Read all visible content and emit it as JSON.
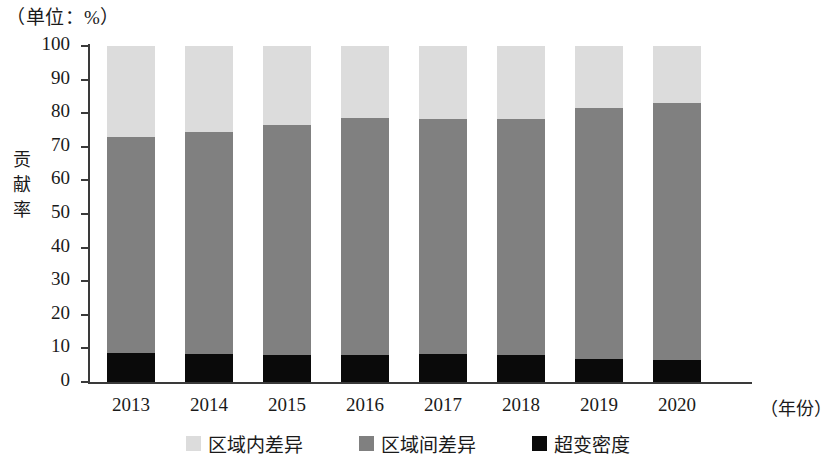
{
  "chart_data": {
    "type": "bar",
    "stacked": true,
    "title": "",
    "unit_caption": "（单位：%）",
    "ylabel": "贡献率",
    "xlabel": "（年份）",
    "categories": [
      "2013",
      "2014",
      "2015",
      "2016",
      "2017",
      "2018",
      "2019",
      "2020"
    ],
    "ylim": [
      0,
      100
    ],
    "yticks": [
      0,
      10,
      20,
      30,
      40,
      50,
      60,
      70,
      80,
      90,
      100
    ],
    "ytick_labels": [
      "0",
      "10",
      "20",
      "30",
      "40",
      "50",
      "60",
      "70",
      "80",
      "90",
      "100"
    ],
    "grid": false,
    "legend_position": "bottom",
    "series": [
      {
        "name": "超变密度",
        "color": "#0a0a0a",
        "values": [
          8.7,
          8.3,
          8.1,
          7.9,
          8.3,
          7.9,
          6.8,
          6.6
        ]
      },
      {
        "name": "区域间差异",
        "color": "#808080",
        "values": [
          64.3,
          66.2,
          68.4,
          70.7,
          70.1,
          70.5,
          74.7,
          76.4
        ]
      },
      {
        "name": "区域内差异",
        "color": "#dcdcdc",
        "values": [
          27.0,
          25.5,
          23.5,
          21.4,
          21.6,
          21.6,
          18.5,
          17.0
        ]
      }
    ],
    "cumulative_tops": {
      "density": [
        8.7,
        8.3,
        8.1,
        7.9,
        8.3,
        7.9,
        6.8,
        6.6
      ],
      "between": [
        73.0,
        74.5,
        76.5,
        78.6,
        78.4,
        78.4,
        81.5,
        83.0
      ],
      "inner": [
        100,
        100,
        100,
        100,
        100,
        100,
        100,
        100
      ]
    }
  },
  "legend": {
    "items": [
      {
        "label": "区域内差异",
        "color": "#dcdcdc"
      },
      {
        "label": "区域间差异",
        "color": "#808080"
      },
      {
        "label": "超变密度",
        "color": "#0a0a0a"
      }
    ]
  }
}
